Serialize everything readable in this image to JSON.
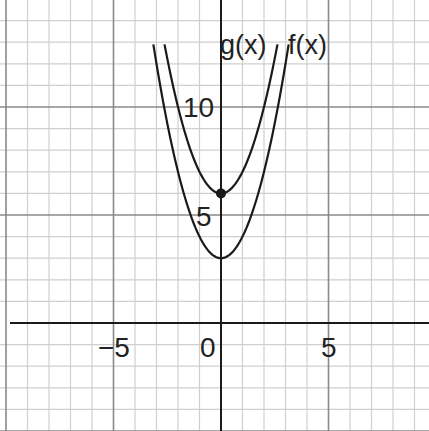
{
  "chart_data": {
    "type": "line",
    "title": "",
    "xlabel": "",
    "ylabel": "",
    "xlim": [
      -10.3,
      9.7
    ],
    "ylim": [
      -5,
      15
    ],
    "grid": true,
    "minor_grid_step": 1,
    "major_grid_step": 5,
    "x_tick_labels": [
      "−5",
      "0",
      "5"
    ],
    "x_ticks": [
      -5,
      0,
      5
    ],
    "y_tick_labels": [
      "5",
      "10"
    ],
    "y_ticks": [
      5,
      10
    ],
    "series": [
      {
        "name": "f(x)",
        "equation": "x^2 + 3",
        "x": [
          -3,
          -2,
          -1,
          0,
          1,
          2,
          3
        ],
        "values": [
          12,
          7,
          4,
          3,
          4,
          7,
          12
        ]
      },
      {
        "name": "g(x)",
        "equation": "x^2 + 6",
        "x": [
          -2.45,
          -2,
          -1,
          0,
          1,
          2,
          2.45
        ],
        "values": [
          12,
          10,
          7,
          6,
          7,
          10,
          12
        ]
      }
    ],
    "annotations": [
      {
        "type": "point",
        "x": 0,
        "y": 6,
        "label": ""
      }
    ],
    "legend": "inline labels at top of curves"
  },
  "labels": {
    "f": "f(x)",
    "g": "g(x)",
    "x_neg5": "−5",
    "x_0": "0",
    "x_5": "5",
    "y_5": "5",
    "y_10": "10"
  },
  "colors": {
    "minor_grid": "#cfcfcf",
    "major_grid": "#8a8a8a",
    "axis": "#1a1a1a",
    "curve": "#1a1a1a"
  }
}
